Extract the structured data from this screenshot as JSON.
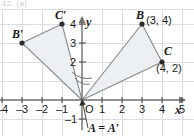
{
  "header": {
    "partial_text": "12. (a)"
  },
  "figure": {
    "title": "",
    "axes": {
      "x_axis_label": "x",
      "y_axis_label": "y",
      "origin_label": "O",
      "x_ticks": [
        "–4",
        "–3",
        "–2",
        "–1",
        "0",
        "1",
        "2",
        "3",
        "4",
        "5"
      ],
      "x_tick_values": [
        -4,
        -3,
        -2,
        -1,
        0,
        1,
        2,
        3,
        4,
        5
      ],
      "y_ticks": [
        "–1",
        "2",
        "3",
        "4"
      ],
      "y_tick_values": [
        -1,
        2,
        3,
        4
      ],
      "xlim": [
        -4.9,
        5.9
      ],
      "ylim": [
        -1.6,
        4.6
      ],
      "grid": true,
      "grid_color": "#d8dde2",
      "axis_color": "#6e6e6e"
    },
    "points": [
      {
        "name": "A",
        "label": "A = A′",
        "x": 0,
        "y": 0,
        "show_dot": false
      },
      {
        "name": "B",
        "label": "B",
        "coord_label": "(3, 4)",
        "x": 3,
        "y": 4,
        "show_dot": true
      },
      {
        "name": "C",
        "label": "C",
        "coord_label": "(4, 2)",
        "x": 4,
        "y": 2,
        "show_dot": true
      },
      {
        "name": "Bp",
        "label": "B′",
        "x": -4,
        "y": 3,
        "show_dot": true
      },
      {
        "name": "Cp",
        "label": "C′",
        "x": -2,
        "y": 4,
        "show_dot": true
      }
    ],
    "triangles": [
      {
        "name": "ABC",
        "vertices": [
          [
            0,
            0
          ],
          [
            3,
            4
          ],
          [
            4,
            2
          ]
        ]
      },
      {
        "name": "A′B′C′",
        "vertices": [
          [
            0,
            0
          ],
          [
            -4,
            3
          ],
          [
            -2,
            4
          ]
        ]
      }
    ],
    "angle_arc": {
      "present": true,
      "at": [
        0,
        0
      ]
    },
    "callout": {
      "text": "A = A′",
      "points_to": [
        0,
        0
      ]
    },
    "colors": {
      "fill": "#eceff1",
      "stroke": "#8a8a8a",
      "dot": "#2b2b2b",
      "text": "#1a1a1a"
    }
  }
}
